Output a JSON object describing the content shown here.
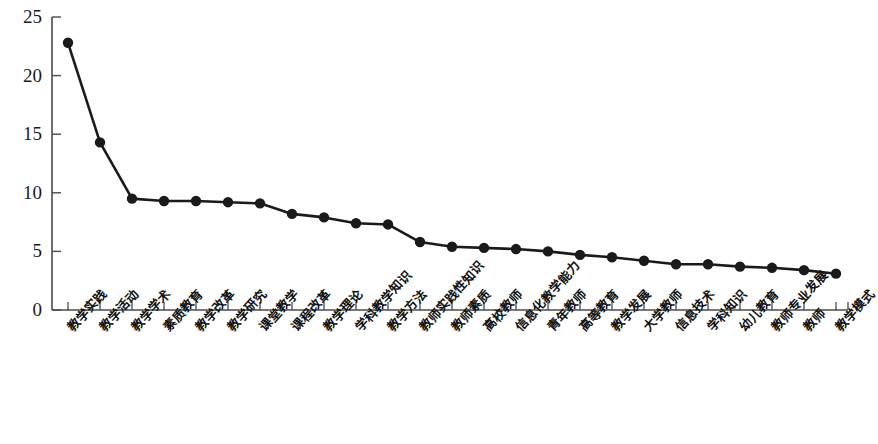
{
  "chart_data": {
    "type": "line",
    "title": "",
    "xlabel": "",
    "ylabel": "",
    "ylim": [
      0,
      25
    ],
    "yticks": [
      0,
      5,
      10,
      15,
      20,
      25
    ],
    "grid": false,
    "legend": "none",
    "marker": "filled-circle",
    "line_color": "#1a1a1a",
    "categories": [
      "教学实践",
      "教学活动",
      "教学学术",
      "素质教育",
      "教学改革",
      "教学研究",
      "课堂教学",
      "课程改革",
      "教学理论",
      "学科教学知识",
      "教学方法",
      "教师实践性知识",
      "教师素质",
      "高校教师",
      "信息化教学能力",
      "青年教师",
      "高等教育",
      "教学发展",
      "大学教师",
      "信息技术",
      "学科知识",
      "幼儿教育",
      "教师专业发展",
      "教师",
      "教学模式"
    ],
    "values": [
      22.8,
      14.3,
      9.5,
      9.3,
      9.3,
      9.2,
      9.1,
      8.2,
      7.9,
      7.4,
      7.3,
      5.8,
      5.4,
      5.3,
      5.2,
      5.0,
      4.7,
      4.5,
      4.2,
      3.9,
      3.9,
      3.7,
      3.6,
      3.4,
      3.1
    ]
  }
}
